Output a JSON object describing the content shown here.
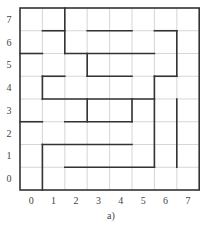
{
  "figure": {
    "caption": "a)",
    "grid_size": 8,
    "column_labels": [
      "0",
      "1",
      "2",
      "3",
      "4",
      "5",
      "6",
      "7"
    ],
    "row_labels": [
      "7",
      "6",
      "5",
      "4",
      "3",
      "2",
      "1",
      "0"
    ],
    "colors": {
      "wall": "#333333",
      "grid": "#cccccc",
      "label": "#444444"
    },
    "walls_description": "Maze walls as segments in grid-line coordinates (gx: 0..8 left to right, gy: 0..8 top to bottom)",
    "walls": [
      [
        2,
        0,
        2,
        2
      ],
      [
        1,
        1,
        2,
        1
      ],
      [
        3,
        1,
        5,
        1
      ],
      [
        6,
        1,
        7,
        1
      ],
      [
        7,
        1,
        7,
        3
      ],
      [
        0,
        2,
        1,
        2
      ],
      [
        2,
        2,
        6,
        2
      ],
      [
        3,
        2,
        3,
        3
      ],
      [
        1,
        3,
        2,
        3
      ],
      [
        3,
        3,
        5,
        3
      ],
      [
        6,
        3,
        7,
        3
      ],
      [
        1,
        3,
        1,
        4
      ],
      [
        6,
        3,
        6,
        7
      ],
      [
        1,
        4,
        6,
        4
      ],
      [
        3,
        4,
        3,
        5
      ],
      [
        5,
        4,
        5,
        5
      ],
      [
        7,
        4,
        7,
        7
      ],
      [
        0,
        5,
        1,
        5
      ],
      [
        2,
        5,
        5,
        5
      ],
      [
        1,
        6,
        5,
        6
      ],
      [
        1,
        6,
        1,
        8
      ],
      [
        2,
        7,
        6,
        7
      ]
    ]
  }
}
